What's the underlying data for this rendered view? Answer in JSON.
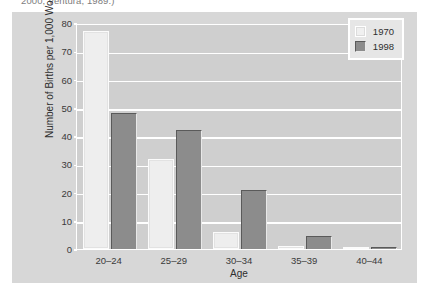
{
  "caption": {
    "clipped_line": "2000; Ventura, 1989.)"
  },
  "colors": {
    "figure_background": "#d7d7d7",
    "plot_background": "#cfcfcf",
    "gridline": "#ffffff",
    "series_1970": "#eeeeee",
    "series_1998": "#8c8c8c",
    "text": "#2e2e2e"
  },
  "legend": {
    "position": "top-right",
    "entries": [
      {
        "label": "1970",
        "swatch": "light"
      },
      {
        "label": "1998",
        "swatch": "dark"
      }
    ]
  },
  "chart_data": {
    "type": "bar",
    "title": "",
    "subtitle": "",
    "xlabel": "Age",
    "ylabel": "Number of Births per 1,000 Women",
    "categories": [
      "20–24",
      "25–29",
      "30–34",
      "35–39",
      "40–44"
    ],
    "series": [
      {
        "name": "1970",
        "values": [
          77,
          32,
          6,
          1,
          0.3
        ]
      },
      {
        "name": "1998",
        "values": [
          48,
          42,
          21,
          4.5,
          0.5
        ]
      }
    ],
    "ylim": [
      0,
      80
    ],
    "yticks": [
      0,
      10,
      20,
      30,
      40,
      50,
      60,
      70,
      80
    ],
    "ytick_labels": [
      "0",
      "10",
      "20",
      "30",
      "40",
      "50",
      "60",
      "70",
      "80"
    ],
    "grid": true,
    "grid_axis": "y",
    "legend_position": "upper right",
    "annotations": []
  }
}
